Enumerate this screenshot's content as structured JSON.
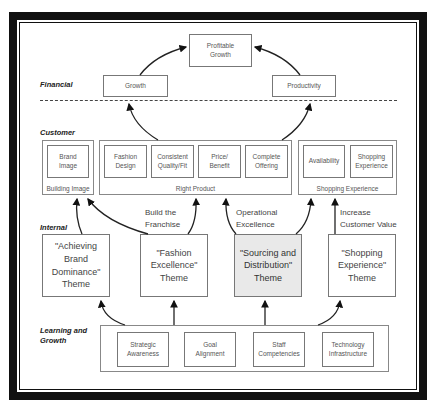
{
  "levels": {
    "financial": "Financial",
    "customer": "Customer",
    "internal": "Internal",
    "learning": "Learning and\nGrowth"
  },
  "financial": {
    "top": "Profitable\nGrowth",
    "growth": "Growth",
    "productivity": "Productivity"
  },
  "customer": {
    "building_image": {
      "label": "Building Image",
      "items": [
        "Brand\nImage"
      ]
    },
    "right_product": {
      "label": "Right Product",
      "items": [
        "Fashion\nDesign",
        "Consistent\nQuality/Fit",
        "Price/\nBenefit",
        "Complete\nOffering"
      ]
    },
    "shopping_experience": {
      "label": "Shopping Experience",
      "items": [
        "Availability",
        "Shopping\nExperience"
      ]
    }
  },
  "annotations": {
    "build_franchise": "Build the\nFranchise",
    "operational_excellence": "Operational\nExcellence",
    "increase_customer_value": "Increase\nCustomer Value"
  },
  "internal": {
    "themes": [
      {
        "label": "\"Achieving\nBrand\nDominance\"\nTheme",
        "shaded": false
      },
      {
        "label": "\"Fashion\nExcellence\"\nTheme",
        "shaded": false
      },
      {
        "label": "\"Sourcing and\nDistribution\"\nTheme",
        "shaded": true
      },
      {
        "label": "\"Shopping\nExperience\"\nTheme",
        "shaded": false
      }
    ]
  },
  "learning": {
    "items": [
      "Strategic\nAwareness",
      "Goal\nAlignment",
      "Staff\nCompetencies",
      "Technology\nInfrastructure"
    ]
  },
  "colors": {
    "frame": "#111111",
    "box_border": "#777777",
    "shaded_theme": "#e9e9e9"
  }
}
